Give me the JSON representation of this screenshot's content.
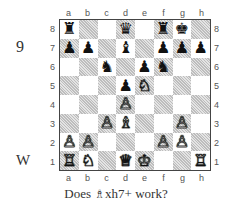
{
  "puzzle": {
    "number": "9",
    "side_to_move": "W",
    "caption_prefix": "Does ",
    "caption_piece_icon": "♗",
    "caption_suffix": "xh7+ work?"
  },
  "board": {
    "files": [
      "a",
      "b",
      "c",
      "d",
      "e",
      "f",
      "g",
      "h"
    ],
    "ranks": [
      "8",
      "7",
      "6",
      "5",
      "4",
      "3",
      "2",
      "1"
    ],
    "rows": [
      [
        {
          "p": "♜",
          "c": "b"
        },
        {
          "p": "",
          "c": ""
        },
        {
          "p": "",
          "c": ""
        },
        {
          "p": "♛",
          "c": "b"
        },
        {
          "p": "",
          "c": ""
        },
        {
          "p": "♜",
          "c": "b"
        },
        {
          "p": "♚",
          "c": "b"
        },
        {
          "p": "",
          "c": ""
        }
      ],
      [
        {
          "p": "♟",
          "c": "b"
        },
        {
          "p": "♟",
          "c": "b"
        },
        {
          "p": "",
          "c": ""
        },
        {
          "p": "♝",
          "c": "b"
        },
        {
          "p": "",
          "c": ""
        },
        {
          "p": "♟",
          "c": "b"
        },
        {
          "p": "♟",
          "c": "b"
        },
        {
          "p": "♟",
          "c": "b"
        }
      ],
      [
        {
          "p": "",
          "c": ""
        },
        {
          "p": "",
          "c": ""
        },
        {
          "p": "♞",
          "c": "b"
        },
        {
          "p": "",
          "c": ""
        },
        {
          "p": "♟",
          "c": "b"
        },
        {
          "p": "♞",
          "c": "b"
        },
        {
          "p": "",
          "c": ""
        },
        {
          "p": "",
          "c": ""
        }
      ],
      [
        {
          "p": "",
          "c": ""
        },
        {
          "p": "",
          "c": ""
        },
        {
          "p": "",
          "c": ""
        },
        {
          "p": "♟",
          "c": "b"
        },
        {
          "p": "♘",
          "c": "w"
        },
        {
          "p": "",
          "c": ""
        },
        {
          "p": "",
          "c": ""
        },
        {
          "p": "",
          "c": ""
        }
      ],
      [
        {
          "p": "",
          "c": ""
        },
        {
          "p": "",
          "c": ""
        },
        {
          "p": "",
          "c": ""
        },
        {
          "p": "♙",
          "c": "w"
        },
        {
          "p": "",
          "c": ""
        },
        {
          "p": "",
          "c": ""
        },
        {
          "p": "",
          "c": ""
        },
        {
          "p": "",
          "c": ""
        }
      ],
      [
        {
          "p": "",
          "c": ""
        },
        {
          "p": "",
          "c": ""
        },
        {
          "p": "♙",
          "c": "w"
        },
        {
          "p": "♗",
          "c": "w"
        },
        {
          "p": "",
          "c": ""
        },
        {
          "p": "",
          "c": ""
        },
        {
          "p": "♙",
          "c": "w"
        },
        {
          "p": "",
          "c": ""
        }
      ],
      [
        {
          "p": "♙",
          "c": "w"
        },
        {
          "p": "♙",
          "c": "w"
        },
        {
          "p": "",
          "c": ""
        },
        {
          "p": "",
          "c": ""
        },
        {
          "p": "",
          "c": ""
        },
        {
          "p": "♙",
          "c": "w"
        },
        {
          "p": "♙",
          "c": "w"
        },
        {
          "p": "",
          "c": ""
        }
      ],
      [
        {
          "p": "♖",
          "c": "w"
        },
        {
          "p": "♘",
          "c": "w"
        },
        {
          "p": "",
          "c": ""
        },
        {
          "p": "♕",
          "c": "w"
        },
        {
          "p": "♔",
          "c": "w"
        },
        {
          "p": "",
          "c": ""
        },
        {
          "p": "",
          "c": ""
        },
        {
          "p": "♖",
          "c": "w"
        }
      ]
    ]
  }
}
